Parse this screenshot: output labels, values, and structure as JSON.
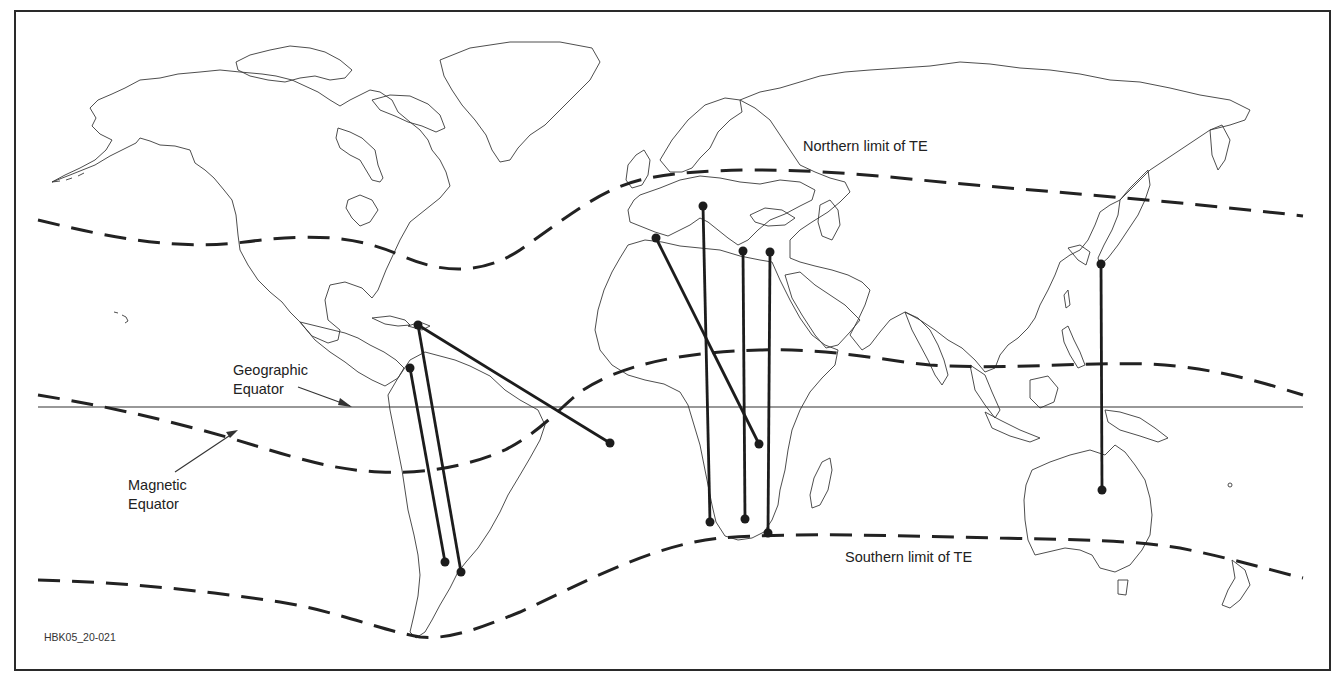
{
  "figure": {
    "code": "HBK05_20-021",
    "frame_color": "#2a2a2a"
  },
  "labels": {
    "northern_limit": "Northern limit of TE",
    "southern_limit": "Southern limit of TE",
    "geographic_equator_line1": "Geographic",
    "geographic_equator_line2": "Equator",
    "magnetic_equator_line1": "Magnetic",
    "magnetic_equator_line2": "Equator"
  },
  "legend": {
    "dashed_lines": [
      "Northern limit of TE",
      "Magnetic Equator",
      "Southern limit of TE"
    ],
    "solid_line": "Geographic Equator"
  },
  "propagation_paths": [
    {
      "region": "Caribbean – Atlantic (West Africa offshore)",
      "from": [
        418,
        325
      ],
      "to": [
        610,
        443
      ]
    },
    {
      "region": "Caribbean – Argentina",
      "from": [
        418,
        325
      ],
      "to": [
        461,
        572
      ]
    },
    {
      "region": "Colombia/Venezuela – Argentina",
      "from": [
        410,
        368
      ],
      "to": [
        445,
        562
      ]
    },
    {
      "region": "Spain/Morocco – East Africa",
      "from": [
        656,
        238
      ],
      "to": [
        759,
        444
      ]
    },
    {
      "region": "Italy – South Africa (west)",
      "from": [
        703,
        206
      ],
      "to": [
        710,
        522
      ]
    },
    {
      "region": "Greece/Crete – South Africa",
      "from": [
        743,
        251
      ],
      "to": [
        745,
        519
      ]
    },
    {
      "region": "Cyprus/Levant – South Africa (east)",
      "from": [
        770,
        252
      ],
      "to": [
        768,
        533
      ]
    },
    {
      "region": "Japan – Australia",
      "from": [
        1101,
        264
      ],
      "to": [
        1102,
        490
      ]
    }
  ]
}
